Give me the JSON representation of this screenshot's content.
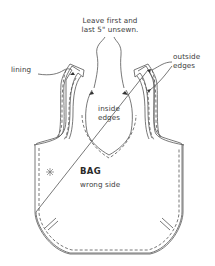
{
  "diagram": {
    "type": "sewing-instruction",
    "stroke_color": "#555555",
    "text_color": "#3a3a3a",
    "labels": {
      "top_note_line1": "Leave first and",
      "top_note_line2": "last 5\" unsewn.",
      "lining": "lining",
      "outside_line1": "outside",
      "outside_line2": "edges",
      "inside_line1": "inside",
      "inside_line2": "edges",
      "bag_title": "BAG",
      "bag_subtitle": "wrong side"
    },
    "icons": {
      "asterisk": "asterisk-mark",
      "arrows": "arrowhead"
    }
  }
}
